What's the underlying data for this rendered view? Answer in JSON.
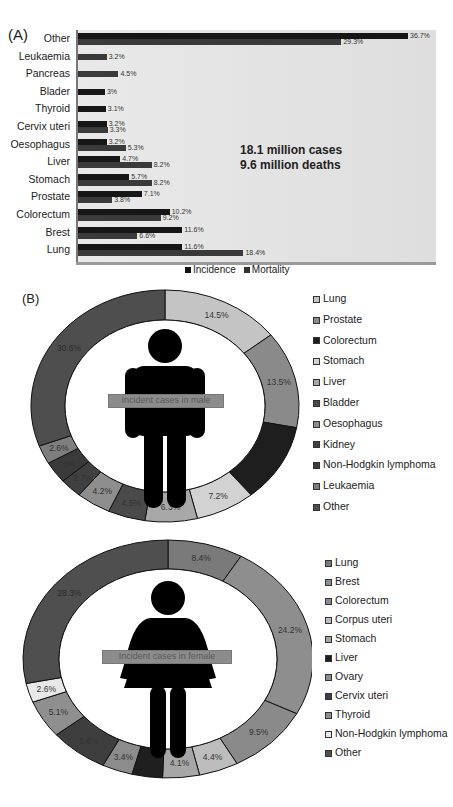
{
  "chart_data": [
    {
      "type": "bar",
      "orientation": "horizontal",
      "panel_label": "(A)",
      "categories": [
        "Other",
        "Leukaemia",
        "Pancreas",
        "Blader",
        "Thyroid",
        "Cervix uteri",
        "Oesophagus",
        "Liver",
        "Stomach",
        "Prostate",
        "Colorectum",
        "Brest",
        "Lung"
      ],
      "series": [
        {
          "name": "Incidence",
          "values": [
            36.7,
            null,
            null,
            3.0,
            3.1,
            3.2,
            3.2,
            4.7,
            5.7,
            7.1,
            10.2,
            11.6,
            11.6
          ],
          "color": "#161616"
        },
        {
          "name": "Mortality",
          "values": [
            29.3,
            3.2,
            4.5,
            null,
            null,
            3.3,
            5.3,
            8.2,
            8.2,
            3.8,
            9.2,
            6.6,
            18.4
          ],
          "color": "#3a3a3a"
        }
      ],
      "value_labels": [
        {
          "category": "Other",
          "labels": [
            "36.7%",
            "29.3%"
          ]
        },
        {
          "category": "Leukaemia",
          "labels": [
            "3.2%"
          ]
        },
        {
          "category": "Pancreas",
          "labels": [
            "4.5%"
          ]
        },
        {
          "category": "Blader",
          "labels": [
            "3%"
          ]
        },
        {
          "category": "Thyroid",
          "labels": [
            "3.1%"
          ]
        },
        {
          "category": "Cervix uteri",
          "labels": [
            "3.2%",
            "3.3%"
          ]
        },
        {
          "category": "Oesophagus",
          "labels": [
            "3.2%",
            "5.3%"
          ]
        },
        {
          "category": "Liver",
          "labels": [
            "4.7%",
            "8.2%"
          ]
        },
        {
          "category": "Stomach",
          "labels": [
            "5.7%",
            "8.2%"
          ]
        },
        {
          "category": "Prostate",
          "labels": [
            "7.1%",
            "3.8%"
          ]
        },
        {
          "category": "Colorectum",
          "labels": [
            "10.2%",
            "9.2%"
          ]
        },
        {
          "category": "Brest",
          "labels": [
            "11.6%",
            "6.6%"
          ]
        },
        {
          "category": "Lung",
          "labels": [
            "11.6%",
            "18.4%"
          ]
        }
      ],
      "annotations": [
        "18.1 million cases",
        "9.6 million deaths"
      ],
      "legend": [
        "Incidence",
        "Mortality"
      ],
      "legend_position": "bottom",
      "grid": false,
      "xlim": [
        0,
        40
      ]
    },
    {
      "type": "pie",
      "subtype": "donut",
      "panel_label": "(B)",
      "center_label": "Incident cases in male",
      "categories": [
        "Lung",
        "Prostate",
        "Colorectum",
        "Stomach",
        "Liver",
        "Bladder",
        "Oesophagus",
        "Kidney",
        "Non-Hodgkin lymphoma",
        "Leukaemia",
        "Other"
      ],
      "values": [
        14.5,
        13.5,
        10.9,
        7.2,
        6.3,
        4.5,
        4.2,
        2.7,
        3.0,
        2.6,
        30.6
      ],
      "value_labels": [
        "14.5%",
        "13.5%",
        "",
        "7.2%",
        "6.3%",
        "4.5%",
        "4.2%",
        "2.7%",
        "3%",
        "2.6%",
        "30.6%"
      ],
      "legend_position": "right"
    },
    {
      "type": "pie",
      "subtype": "donut",
      "center_label": "Incident cases in female",
      "categories": [
        "Lung",
        "Brest",
        "Colorectum",
        "Corpus uteri",
        "Stomach",
        "Liver",
        "Ovary",
        "Cervix uteri",
        "Thyroid",
        "Non-Hodgkin lymphoma",
        "Other"
      ],
      "values": [
        8.4,
        24.2,
        9.5,
        4.4,
        4.1,
        3.4,
        3.4,
        6.6,
        5.1,
        2.6,
        28.3
      ],
      "value_labels": [
        "8.4%",
        "24.2%",
        "9.5%",
        "4.4%",
        "4.1%",
        "",
        "3.4%",
        "6.6%",
        "5.1%",
        "2.6%",
        "28.3%"
      ],
      "legend_position": "right"
    }
  ],
  "panelA": {
    "label": "(A)",
    "annotation_line1": "18.1 million cases",
    "annotation_line2": "9.6 million deaths",
    "legend": {
      "incidence": "Incidence",
      "mortality": "Mortality"
    }
  },
  "panelB": {
    "label": "(B)",
    "male": {
      "center_label": "Incident cases in male",
      "legend": [
        "Lung",
        "Prostate",
        "Colorectum",
        "Stomach",
        "Liver",
        "Bladder",
        "Oesophagus",
        "Kidney",
        "Non-Hodgkin lymphoma",
        "Leukaemia",
        "Other"
      ]
    },
    "female": {
      "center_label": "Incident cases in female",
      "legend": [
        "Lung",
        "Brest",
        "Colorectum",
        "Corpus uteri",
        "Stomach",
        "Liver",
        "Ovary",
        "Cervix uteri",
        "Thyroid",
        "Non-Hodgkin lymphoma",
        "Other"
      ]
    }
  },
  "colors": {
    "male": [
      "#c4c4c4",
      "#8a8a8a",
      "#1e1e1e",
      "#d2d2d2",
      "#a8a8a8",
      "#4a4a4a",
      "#8e8e8e",
      "#404040",
      "#3a3a3a",
      "#7e7e7e",
      "#4e4e4e"
    ],
    "female": [
      "#7a7a7a",
      "#8e8e8e",
      "#8a8a8a",
      "#bdbdbd",
      "#a6a6a6",
      "#1f1f1f",
      "#8c8c8c",
      "#3e3e3e",
      "#8f8f8f",
      "#e8e8e8",
      "#4f4f4f"
    ]
  }
}
